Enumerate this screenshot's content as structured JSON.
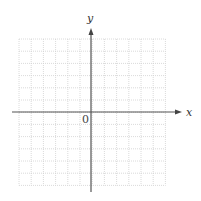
{
  "diagram": {
    "type": "coordinate-plane",
    "x_axis_label": "x",
    "y_axis_label": "y",
    "origin_label": "0",
    "grid": {
      "columns": 12,
      "rows": 12,
      "left": 19,
      "top": 39,
      "cell": 12.2,
      "line_color": "#d0d0d0",
      "line_style": "dotted"
    },
    "axes": {
      "origin_x": 91,
      "origin_y": 112,
      "x_start": 12,
      "x_end": 182,
      "y_start": 192,
      "y_end": 28,
      "color": "#555555"
    }
  }
}
